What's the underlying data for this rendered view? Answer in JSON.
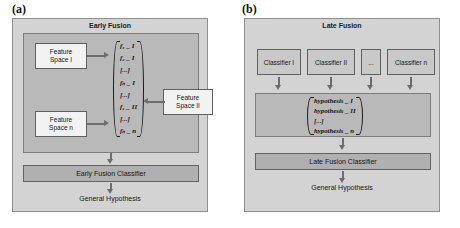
{
  "figure": {
    "panels": [
      {
        "tag": "(a)",
        "title": "Early Fusion",
        "nodes": [
          {
            "line1": "Feature",
            "line2": "Space I"
          },
          {
            "line1": "Feature",
            "line2": "Space n"
          },
          {
            "line1": "Feature",
            "line2": "Space II"
          }
        ],
        "vector": [
          "f₁ _ I",
          "f₂ _ I",
          "[...]",
          "fₙ _ I",
          "[...]",
          "f₁ _ II",
          "[...]",
          "fₙ _ n"
        ],
        "classifier_bar": "Early Fusion Classifier",
        "output": "General Hypothesis"
      },
      {
        "tag": "(b)",
        "title": "Late Fusion",
        "classifiers": [
          "Classifier I",
          "Classifier II",
          "...",
          "Classifier n"
        ],
        "vector": [
          "hypothesis _ I",
          "hypothesis _ II",
          "[...]",
          "hypothesis _ n"
        ],
        "classifier_bar": "Late Fusion Classifier",
        "output": "General Hypothesis"
      }
    ]
  },
  "colors": {
    "panel_background": "#d3d3d3",
    "inner_group": "#b9b9b9",
    "bar_fill": "#b0b0b0",
    "node_fill": "#f2f2f2",
    "arrow": "#6d6d6d"
  }
}
